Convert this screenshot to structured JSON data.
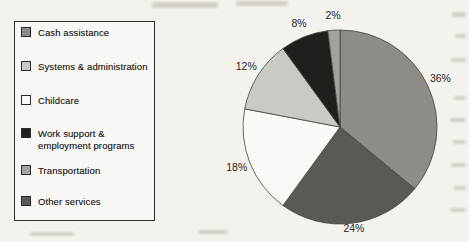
{
  "figure": {
    "background_color": "#f4f2ec"
  },
  "legend": {
    "position": "left",
    "items": [
      {
        "id": "cash-assistance",
        "lines": [
          "Cash assistance"
        ],
        "color": "#8f8c88"
      },
      {
        "id": "systems-administration",
        "lines": [
          "Systems & administration"
        ],
        "color": "#cbc9c4"
      },
      {
        "id": "childcare",
        "lines": [
          "Childcare"
        ],
        "color": "#faf9f6"
      },
      {
        "id": "work-support",
        "lines": [
          "Work support &",
          "employment programs"
        ],
        "color": "#211e1b"
      },
      {
        "id": "transportation",
        "lines": [
          "Transportation"
        ],
        "color": "#a5a29d"
      },
      {
        "id": "other-services",
        "lines": [
          "Other services"
        ],
        "color": "#5c5853"
      }
    ]
  },
  "chart_data": {
    "type": "pie",
    "title": "",
    "unit": "percent",
    "direction": "clockwise",
    "start_angle_deg_from_top": 0,
    "legend_position": "left",
    "slices": [
      {
        "label": "Cash assistance",
        "value": 36,
        "data_label": "36%",
        "color": "#8f8c88"
      },
      {
        "label": "Other services",
        "value": 24,
        "data_label": "24%",
        "color": "#5c5853"
      },
      {
        "label": "Childcare",
        "value": 18,
        "data_label": "18%",
        "color": "#faf9f6"
      },
      {
        "label": "Systems & administration",
        "value": 12,
        "data_label": "12%",
        "color": "#cbc9c4"
      },
      {
        "label": "Work support & employment programs",
        "value": 8,
        "data_label": "8%",
        "color": "#211e1b"
      },
      {
        "label": "Transportation",
        "value": 2,
        "data_label": "2%",
        "color": "#a5a29d"
      }
    ]
  }
}
